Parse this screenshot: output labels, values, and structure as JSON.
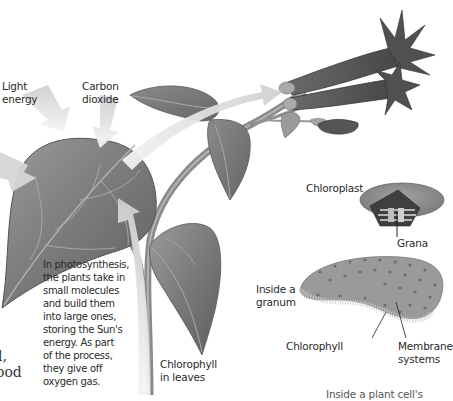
{
  "diagram": {
    "labels": {
      "light_energy": "Light\nenergy",
      "carbon_dioxide": "Carbon\ndioxide",
      "chlorophyll_in_leaves": "Chlorophyll\nin leaves",
      "chloroplast": "Chloroplast",
      "grana": "Grana",
      "inside_granum": "Inside a\ngranum",
      "chlorophyll": "Chlorophyll",
      "membrane_systems": "Membrane\nsystems",
      "bottom_caption_partial": "Inside a plant cell's"
    },
    "paragraph": {
      "lines": [
        "In photosynthesis,",
        "the plants take in",
        "small molecules",
        "and build them",
        "into large ones,",
        "storing the Sun's",
        "energy. As part",
        "of the process,",
        "they give off",
        "oxygen gas."
      ]
    },
    "cropped_left_text": {
      "line1": "l,",
      "line2": "ood"
    },
    "colors": {
      "leaf_dark": "#6b6b6b",
      "leaf_mid": "#8e8e8e",
      "leaf_light": "#b5b5b5",
      "arrow": "#d9d9d9",
      "flower": "#555555",
      "background": "#ffffff"
    }
  }
}
